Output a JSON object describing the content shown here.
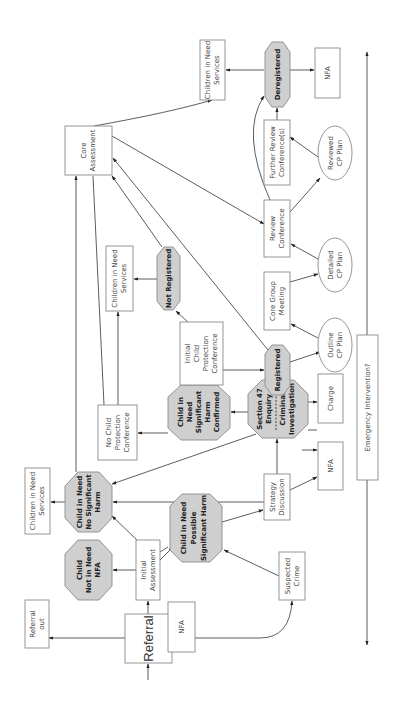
{
  "diagram": {
    "orientation": "rotated-90-ccw",
    "colors": {
      "decision_fill": "#cfcfcf",
      "box_fill": "#ffffff",
      "stroke": "#8a8a8a",
      "edge": "#333333"
    },
    "nodes": {
      "referral": {
        "lines": [
          "Referral"
        ],
        "shape": "box"
      },
      "referral_out": {
        "lines": [
          "Referral",
          "out"
        ],
        "shape": "box"
      },
      "nfa_1": {
        "lines": [
          "NFA"
        ],
        "shape": "box"
      },
      "initial_assessment": {
        "lines": [
          "Initial",
          "Assessment"
        ],
        "shape": "box"
      },
      "not_in_need": {
        "lines": [
          "Child",
          "Not in Need",
          "NFA"
        ],
        "shape": "octagon"
      },
      "suspected_crime": {
        "lines": [
          "Suspected",
          "Crime"
        ],
        "shape": "box"
      },
      "possible_harm": {
        "lines": [
          "Child in Need",
          "Possible",
          "Significant Harm"
        ],
        "shape": "octagon"
      },
      "no_sig_harm": {
        "lines": [
          "Child in Need",
          "No Significant",
          "Harm"
        ],
        "shape": "octagon"
      },
      "cin_services_1": {
        "lines": [
          "Children in Need",
          "Services"
        ],
        "shape": "box"
      },
      "strategy": {
        "lines": [
          "Strategy",
          "Discussion"
        ],
        "shape": "box"
      },
      "nfa_2": {
        "lines": [
          "NFA"
        ],
        "shape": "box"
      },
      "section47": {
        "lines": [
          "Section 47",
          "Enquiry",
          "Criminal",
          "Investigation"
        ],
        "shape": "octagon"
      },
      "charge": {
        "lines": [
          "Charge"
        ],
        "shape": "box"
      },
      "harm_confirmed": {
        "lines": [
          "Child in",
          "Need",
          "Significant",
          "Harm",
          "Confirmed"
        ],
        "shape": "octagon"
      },
      "no_cpc": {
        "lines": [
          "No Child",
          "Protection",
          "Conference"
        ],
        "shape": "box"
      },
      "icpc": {
        "lines": [
          "Initial",
          "Child",
          "Protection",
          "Conference"
        ],
        "shape": "box"
      },
      "registered": {
        "lines": [
          "Registered"
        ],
        "shape": "octagon"
      },
      "not_registered": {
        "lines": [
          "Not Registered"
        ],
        "shape": "octagon"
      },
      "cin_services_2": {
        "lines": [
          "Children in Need",
          "Services"
        ],
        "shape": "box"
      },
      "outline_plan": {
        "lines": [
          "Outline",
          "CP Plan"
        ],
        "shape": "ellipse"
      },
      "core_group": {
        "lines": [
          "Core Group",
          "Meeting"
        ],
        "shape": "box"
      },
      "detailed_plan": {
        "lines": [
          "Detailed",
          "CP Plan"
        ],
        "shape": "ellipse"
      },
      "review_conf": {
        "lines": [
          "Review",
          "Conference"
        ],
        "shape": "box"
      },
      "core_assessment": {
        "lines": [
          "Core",
          "Assessment"
        ],
        "shape": "box"
      },
      "further_review": {
        "lines": [
          "Further Review",
          "Conference(s)"
        ],
        "shape": "box"
      },
      "reviewed_plan": {
        "lines": [
          "Reviewed",
          "CP Plan"
        ],
        "shape": "ellipse"
      },
      "deregistered": {
        "lines": [
          "Deregistered"
        ],
        "shape": "octagon"
      },
      "cin_services_3": {
        "lines": [
          "Children in Need",
          "Services"
        ],
        "shape": "box"
      },
      "nfa_3": {
        "lines": [
          "NFA"
        ],
        "shape": "box"
      },
      "emergency": {
        "lines": [
          "Emergency Intervention?"
        ],
        "shape": "box"
      }
    },
    "edges": [
      [
        "start",
        "referral"
      ],
      [
        "referral",
        "referral_out"
      ],
      [
        "referral",
        "initial_assessment"
      ],
      [
        "referral",
        "suspected_crime"
      ],
      [
        "referral",
        "nfa_1"
      ],
      [
        "initial_assessment",
        "not_in_need"
      ],
      [
        "initial_assessment",
        "no_sig_harm"
      ],
      [
        "initial_assessment",
        "possible_harm"
      ],
      [
        "suspected_crime",
        "possible_harm"
      ],
      [
        "possible_harm",
        "strategy"
      ],
      [
        "strategy",
        "no_sig_harm"
      ],
      [
        "strategy",
        "section47"
      ],
      [
        "strategy",
        "nfa_2"
      ],
      [
        "no_sig_harm",
        "cin_services_1"
      ],
      [
        "no_sig_harm",
        "core_assessment"
      ],
      [
        "section47",
        "no_sig_harm"
      ],
      [
        "section47",
        "harm_confirmed"
      ],
      [
        "section47",
        "nfa_2"
      ],
      [
        "section47",
        "charge"
      ],
      [
        "harm_confirmed",
        "no_cpc"
      ],
      [
        "harm_confirmed",
        "icpc"
      ],
      [
        "no_cpc",
        "cin_services_2"
      ],
      [
        "no_cpc",
        "core_assessment"
      ],
      [
        "icpc",
        "not_registered"
      ],
      [
        "icpc",
        "registered"
      ],
      [
        "not_registered",
        "cin_services_2"
      ],
      [
        "not_registered",
        "core_assessment"
      ],
      [
        "registered",
        "core_assessment"
      ],
      [
        "registered",
        "outline_plan"
      ],
      [
        "outline_plan",
        "core_group"
      ],
      [
        "core_group",
        "detailed_plan"
      ],
      [
        "detailed_plan",
        "review_conf"
      ],
      [
        "core_assessment",
        "review_conf"
      ],
      [
        "review_conf",
        "reviewed_plan"
      ],
      [
        "review_conf",
        "deregistered"
      ],
      [
        "reviewed_plan",
        "further_review"
      ],
      [
        "further_review",
        "deregistered"
      ],
      [
        "core_assessment",
        "cin_services_3"
      ],
      [
        "deregistered",
        "cin_services_3"
      ],
      [
        "deregistered",
        "nfa_3"
      ],
      [
        "emergency",
        "both-directions"
      ]
    ]
  }
}
